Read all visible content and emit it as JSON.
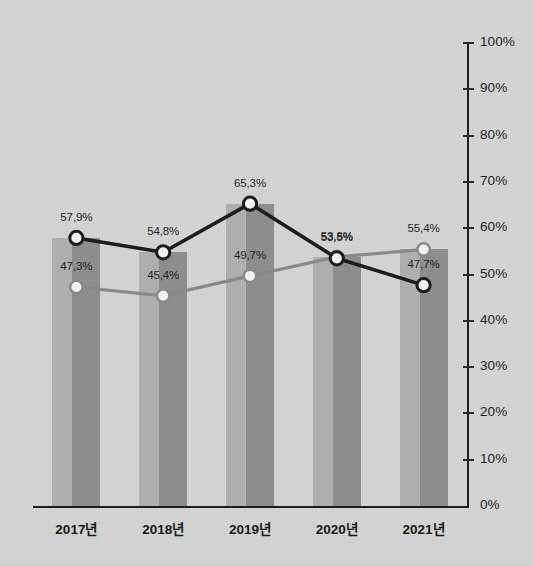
{
  "chart_data": {
    "type": "line",
    "title": "",
    "subtitle": "",
    "xlabel": "",
    "ylabel": "",
    "categories": [
      "2017년",
      "2018년",
      "2019년",
      "2020년",
      "2021년"
    ],
    "ylim": [
      0,
      100
    ],
    "y_tick_labels": [
      "0%",
      "10%",
      "20%",
      "30%",
      "40%",
      "50%",
      "60%",
      "70%",
      "80%",
      "90%",
      "100%"
    ],
    "y_tick_values": [
      0,
      10,
      20,
      30,
      40,
      50,
      60,
      70,
      80,
      90,
      100
    ],
    "y_axis_position": "right",
    "grid": false,
    "legend": "none",
    "series": [
      {
        "name": "dark-line-series",
        "type": "line",
        "color": "#1a1a1a",
        "marker": "circle-white-fill",
        "values": [
          57.9,
          54.8,
          65.3,
          53.5,
          47.7
        ],
        "labels": [
          "57,9%",
          "54,8%",
          "65,3%",
          "53,5%",
          "47,7%"
        ]
      },
      {
        "name": "gray-line-series",
        "type": "line",
        "color": "#8a8a8a",
        "marker": "circle-white-fill",
        "values": [
          47.3,
          45.4,
          49.7,
          53.8,
          55.4
        ],
        "labels": [
          "47,3%",
          "45,4%",
          "49,7%",
          "53,8%",
          "55,4%"
        ]
      },
      {
        "name": "bar-series",
        "type": "bar",
        "color": "#9c9c9c",
        "values": [
          57.9,
          54.8,
          65.3,
          53.8,
          55.4
        ]
      }
    ]
  },
  "colors": {
    "background": "#d5d5d5",
    "bar_light": "#b0b0b0",
    "bar_dark": "#8e8e8e",
    "dark_series": "#1a1a1a",
    "gray_series": "#8a8a8a",
    "axis": "#1b1b1b",
    "text": "#1d1d1d"
  }
}
